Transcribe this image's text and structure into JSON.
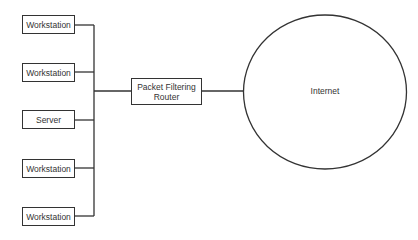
{
  "diagram": {
    "title": "",
    "nodes": [
      {
        "id": "ws1",
        "label": "Workstation",
        "type": "workstation"
      },
      {
        "id": "ws2",
        "label": "Workstation",
        "type": "workstation"
      },
      {
        "id": "srv",
        "label": "Server",
        "type": "server"
      },
      {
        "id": "ws3",
        "label": "Workstation",
        "type": "workstation"
      },
      {
        "id": "ws4",
        "label": "Workstation",
        "type": "workstation"
      }
    ],
    "router": {
      "label_line1": "Packet Filtering",
      "label_line2": "Router"
    },
    "internet": {
      "label": "Internet"
    },
    "colors": {
      "stroke": "#333333",
      "background": "#ffffff",
      "text": "#333333"
    }
  }
}
